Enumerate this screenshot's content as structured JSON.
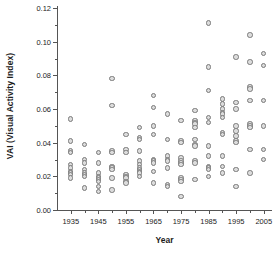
{
  "chart_data": {
    "type": "scatter",
    "title": "",
    "xlabel": "Year",
    "ylabel": "VAI (Visual Activity Index)",
    "xlim": [
      1930,
      2008
    ],
    "ylim": [
      0.0,
      0.12
    ],
    "grid": false,
    "legend": null,
    "xticks": [
      1935,
      1945,
      1955,
      1965,
      1975,
      1985,
      1995,
      2005
    ],
    "xtick_labels": [
      "1935",
      "1945",
      "1955",
      "1965",
      "1975",
      "1985",
      "1995",
      "2005"
    ],
    "xminor_ticks": [
      1940,
      1950,
      1960,
      1970,
      1980,
      1990,
      2000
    ],
    "yticks": [
      0.0,
      0.02,
      0.04,
      0.06,
      0.08,
      0.1,
      0.12
    ],
    "ytick_labels": [
      "0.00",
      "0.02",
      "0.04",
      "0.06",
      "0.08",
      "0.10",
      "0.12"
    ],
    "yminor_ticks": [
      0.01,
      0.03,
      0.05,
      0.07,
      0.09,
      0.11
    ],
    "marker": {
      "shape": "circle",
      "fill_color": "#dcdcdc",
      "edge_color": "#7a7a7a",
      "size_px": 5.4
    },
    "points": [
      {
        "x": 1935,
        "y": 0.054
      },
      {
        "x": 1935,
        "y": 0.041
      },
      {
        "x": 1935,
        "y": 0.035
      },
      {
        "x": 1935,
        "y": 0.034
      },
      {
        "x": 1935,
        "y": 0.027
      },
      {
        "x": 1935,
        "y": 0.025
      },
      {
        "x": 1935,
        "y": 0.023
      },
      {
        "x": 1935,
        "y": 0.022
      },
      {
        "x": 1935,
        "y": 0.021
      },
      {
        "x": 1935,
        "y": 0.019
      },
      {
        "x": 1940,
        "y": 0.039
      },
      {
        "x": 1940,
        "y": 0.03
      },
      {
        "x": 1940,
        "y": 0.028
      },
      {
        "x": 1940,
        "y": 0.024
      },
      {
        "x": 1940,
        "y": 0.022
      },
      {
        "x": 1940,
        "y": 0.021
      },
      {
        "x": 1940,
        "y": 0.02
      },
      {
        "x": 1940,
        "y": 0.013
      },
      {
        "x": 1945,
        "y": 0.034
      },
      {
        "x": 1945,
        "y": 0.028
      },
      {
        "x": 1945,
        "y": 0.022
      },
      {
        "x": 1945,
        "y": 0.02
      },
      {
        "x": 1945,
        "y": 0.019
      },
      {
        "x": 1945,
        "y": 0.018
      },
      {
        "x": 1945,
        "y": 0.017
      },
      {
        "x": 1945,
        "y": 0.014
      },
      {
        "x": 1945,
        "y": 0.011
      },
      {
        "x": 1950,
        "y": 0.078
      },
      {
        "x": 1950,
        "y": 0.062
      },
      {
        "x": 1950,
        "y": 0.035
      },
      {
        "x": 1950,
        "y": 0.034
      },
      {
        "x": 1950,
        "y": 0.026
      },
      {
        "x": 1950,
        "y": 0.025
      },
      {
        "x": 1950,
        "y": 0.024
      },
      {
        "x": 1950,
        "y": 0.019
      },
      {
        "x": 1950,
        "y": 0.012
      },
      {
        "x": 1955,
        "y": 0.045
      },
      {
        "x": 1955,
        "y": 0.036
      },
      {
        "x": 1955,
        "y": 0.034
      },
      {
        "x": 1955,
        "y": 0.021
      },
      {
        "x": 1955,
        "y": 0.02
      },
      {
        "x": 1955,
        "y": 0.019
      },
      {
        "x": 1955,
        "y": 0.017
      },
      {
        "x": 1955,
        "y": 0.016
      },
      {
        "x": 1960,
        "y": 0.049
      },
      {
        "x": 1960,
        "y": 0.043
      },
      {
        "x": 1960,
        "y": 0.042
      },
      {
        "x": 1960,
        "y": 0.035
      },
      {
        "x": 1960,
        "y": 0.029
      },
      {
        "x": 1960,
        "y": 0.027
      },
      {
        "x": 1960,
        "y": 0.025
      },
      {
        "x": 1960,
        "y": 0.024
      },
      {
        "x": 1960,
        "y": 0.023
      },
      {
        "x": 1960,
        "y": 0.022
      },
      {
        "x": 1960,
        "y": 0.02
      },
      {
        "x": 1965,
        "y": 0.068
      },
      {
        "x": 1965,
        "y": 0.061
      },
      {
        "x": 1965,
        "y": 0.05
      },
      {
        "x": 1965,
        "y": 0.045
      },
      {
        "x": 1965,
        "y": 0.03
      },
      {
        "x": 1965,
        "y": 0.029
      },
      {
        "x": 1965,
        "y": 0.028
      },
      {
        "x": 1965,
        "y": 0.023
      },
      {
        "x": 1965,
        "y": 0.016
      },
      {
        "x": 1970,
        "y": 0.057
      },
      {
        "x": 1970,
        "y": 0.042
      },
      {
        "x": 1970,
        "y": 0.032
      },
      {
        "x": 1970,
        "y": 0.03
      },
      {
        "x": 1970,
        "y": 0.029
      },
      {
        "x": 1970,
        "y": 0.025
      },
      {
        "x": 1970,
        "y": 0.015
      },
      {
        "x": 1970,
        "y": 0.014
      },
      {
        "x": 1975,
        "y": 0.053
      },
      {
        "x": 1975,
        "y": 0.041
      },
      {
        "x": 1975,
        "y": 0.04
      },
      {
        "x": 1975,
        "y": 0.031
      },
      {
        "x": 1975,
        "y": 0.029
      },
      {
        "x": 1975,
        "y": 0.028
      },
      {
        "x": 1975,
        "y": 0.027
      },
      {
        "x": 1975,
        "y": 0.019
      },
      {
        "x": 1975,
        "y": 0.018
      },
      {
        "x": 1975,
        "y": 0.017
      },
      {
        "x": 1975,
        "y": 0.008
      },
      {
        "x": 1980,
        "y": 0.059
      },
      {
        "x": 1980,
        "y": 0.053
      },
      {
        "x": 1980,
        "y": 0.052
      },
      {
        "x": 1980,
        "y": 0.051
      },
      {
        "x": 1980,
        "y": 0.049
      },
      {
        "x": 1980,
        "y": 0.042
      },
      {
        "x": 1980,
        "y": 0.039
      },
      {
        "x": 1980,
        "y": 0.038
      },
      {
        "x": 1980,
        "y": 0.029
      },
      {
        "x": 1980,
        "y": 0.028
      },
      {
        "x": 1980,
        "y": 0.018
      },
      {
        "x": 1985,
        "y": 0.111
      },
      {
        "x": 1985,
        "y": 0.085
      },
      {
        "x": 1985,
        "y": 0.071
      },
      {
        "x": 1985,
        "y": 0.055
      },
      {
        "x": 1985,
        "y": 0.052
      },
      {
        "x": 1985,
        "y": 0.038
      },
      {
        "x": 1985,
        "y": 0.032
      },
      {
        "x": 1985,
        "y": 0.026
      },
      {
        "x": 1985,
        "y": 0.025
      },
      {
        "x": 1985,
        "y": 0.024
      },
      {
        "x": 1985,
        "y": 0.02
      },
      {
        "x": 1990,
        "y": 0.066
      },
      {
        "x": 1990,
        "y": 0.063
      },
      {
        "x": 1990,
        "y": 0.06
      },
      {
        "x": 1990,
        "y": 0.058
      },
      {
        "x": 1990,
        "y": 0.057
      },
      {
        "x": 1990,
        "y": 0.055
      },
      {
        "x": 1990,
        "y": 0.046
      },
      {
        "x": 1990,
        "y": 0.045
      },
      {
        "x": 1990,
        "y": 0.032
      },
      {
        "x": 1990,
        "y": 0.026
      },
      {
        "x": 1990,
        "y": 0.022
      },
      {
        "x": 1995,
        "y": 0.091
      },
      {
        "x": 1995,
        "y": 0.064
      },
      {
        "x": 1995,
        "y": 0.06
      },
      {
        "x": 1995,
        "y": 0.05
      },
      {
        "x": 1995,
        "y": 0.047
      },
      {
        "x": 1995,
        "y": 0.044
      },
      {
        "x": 1995,
        "y": 0.041
      },
      {
        "x": 1995,
        "y": 0.04
      },
      {
        "x": 1995,
        "y": 0.024
      },
      {
        "x": 1995,
        "y": 0.014
      },
      {
        "x": 2000,
        "y": 0.104
      },
      {
        "x": 2000,
        "y": 0.088
      },
      {
        "x": 2000,
        "y": 0.073
      },
      {
        "x": 2000,
        "y": 0.072
      },
      {
        "x": 2000,
        "y": 0.065
      },
      {
        "x": 2000,
        "y": 0.051
      },
      {
        "x": 2000,
        "y": 0.05
      },
      {
        "x": 2000,
        "y": 0.049
      },
      {
        "x": 2000,
        "y": 0.036
      },
      {
        "x": 2000,
        "y": 0.022
      },
      {
        "x": 2005,
        "y": 0.093
      },
      {
        "x": 2005,
        "y": 0.086
      },
      {
        "x": 2005,
        "y": 0.065
      },
      {
        "x": 2005,
        "y": 0.05
      },
      {
        "x": 2005,
        "y": 0.036
      },
      {
        "x": 2005,
        "y": 0.03
      }
    ]
  }
}
